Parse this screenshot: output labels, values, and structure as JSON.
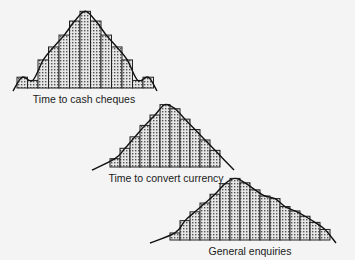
{
  "chart_data": [
    {
      "type": "bar",
      "title": "Time to cash cheques",
      "xlabel": "Time to cash cheques",
      "ylabel": "",
      "shape": "normal distribution (symmetric)",
      "overlay": "bell curve",
      "grid": false,
      "categories": [
        1,
        2,
        3,
        4,
        5,
        6,
        7,
        8,
        9,
        10,
        11,
        12,
        13
      ],
      "values": [
        1.0,
        0.7,
        2.6,
        3.8,
        4.9,
        6.2,
        7.1,
        6.2,
        4.9,
        3.8,
        2.6,
        0.7,
        1.0
      ]
    },
    {
      "type": "bar",
      "title": "Time to convert currency",
      "xlabel": "Time to convert currency",
      "ylabel": "",
      "shape": "approximately normal, slightly right-skewed",
      "overlay": "smooth curve",
      "grid": false,
      "categories": [
        1,
        2,
        3,
        4,
        5,
        6,
        7,
        8,
        9,
        10,
        11
      ],
      "values": [
        0.8,
        1.8,
        2.9,
        4.0,
        5.0,
        6.0,
        5.6,
        4.6,
        3.6,
        2.6,
        1.6
      ]
    },
    {
      "type": "bar",
      "title": "General enquiries",
      "xlabel": "General enquiries",
      "ylabel": "",
      "shape": "right-skewed",
      "overlay": "smooth curve",
      "grid": false,
      "categories": [
        1,
        2,
        3,
        4,
        5,
        6,
        7,
        8,
        9,
        10,
        11,
        12,
        13,
        14,
        15,
        16
      ],
      "values": [
        0.8,
        2.2,
        3.2,
        4.2,
        5.2,
        6.4,
        7.0,
        6.5,
        5.7,
        5.0,
        4.7,
        3.8,
        3.3,
        2.7,
        2.0,
        1.2
      ]
    }
  ],
  "labels": {
    "chart1": "Time to cash cheques",
    "chart2": "Time to convert currency",
    "chart3": "General enquiries"
  }
}
